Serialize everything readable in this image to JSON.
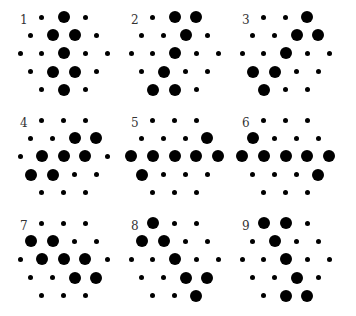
{
  "figure": {
    "row_lengths": [
      3,
      4,
      5,
      4,
      3
    ],
    "panels": [
      {
        "label": "1",
        "rows": [
          [
            0,
            1,
            0
          ],
          [
            0,
            1,
            1,
            0
          ],
          [
            0,
            0,
            1,
            0,
            0
          ],
          [
            0,
            1,
            1,
            0
          ],
          [
            0,
            1,
            0
          ]
        ]
      },
      {
        "label": "2",
        "rows": [
          [
            0,
            1,
            1
          ],
          [
            0,
            0,
            1,
            0
          ],
          [
            0,
            0,
            1,
            0,
            0
          ],
          [
            0,
            1,
            0,
            0
          ],
          [
            1,
            1,
            0
          ]
        ]
      },
      {
        "label": "3",
        "rows": [
          [
            0,
            0,
            1
          ],
          [
            0,
            0,
            1,
            1
          ],
          [
            0,
            0,
            1,
            0,
            0
          ],
          [
            1,
            1,
            0,
            0
          ],
          [
            1,
            0,
            0
          ]
        ]
      },
      {
        "label": "4",
        "rows": [
          [
            0,
            0,
            0
          ],
          [
            0,
            0,
            1,
            1
          ],
          [
            0,
            1,
            1,
            1,
            0
          ],
          [
            1,
            1,
            0,
            0
          ],
          [
            0,
            0,
            0
          ]
        ]
      },
      {
        "label": "5",
        "rows": [
          [
            0,
            0,
            0
          ],
          [
            0,
            0,
            0,
            1
          ],
          [
            1,
            1,
            1,
            1,
            1
          ],
          [
            1,
            0,
            0,
            0
          ],
          [
            0,
            0,
            0
          ]
        ]
      },
      {
        "label": "6",
        "rows": [
          [
            0,
            0,
            0
          ],
          [
            1,
            0,
            0,
            0
          ],
          [
            1,
            1,
            1,
            1,
            1
          ],
          [
            0,
            0,
            0,
            1
          ],
          [
            0,
            0,
            0
          ]
        ]
      },
      {
        "label": "7",
        "rows": [
          [
            0,
            0,
            0
          ],
          [
            1,
            1,
            0,
            0
          ],
          [
            0,
            1,
            1,
            1,
            0
          ],
          [
            0,
            0,
            1,
            1
          ],
          [
            0,
            0,
            0
          ]
        ]
      },
      {
        "label": "8",
        "rows": [
          [
            1,
            0,
            0
          ],
          [
            1,
            1,
            0,
            0
          ],
          [
            0,
            0,
            1,
            0,
            0
          ],
          [
            0,
            0,
            1,
            1
          ],
          [
            0,
            0,
            1
          ]
        ]
      },
      {
        "label": "9",
        "rows": [
          [
            1,
            1,
            0
          ],
          [
            0,
            1,
            0,
            0
          ],
          [
            0,
            0,
            1,
            0,
            0
          ],
          [
            0,
            0,
            1,
            0
          ],
          [
            0,
            1,
            1
          ]
        ]
      }
    ]
  }
}
